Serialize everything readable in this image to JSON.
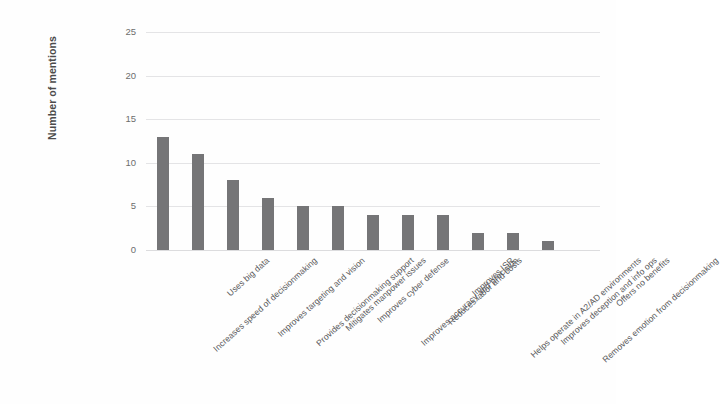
{
  "chart_data": {
    "type": "bar",
    "title": "",
    "xlabel": "",
    "ylabel": "Number of mentions",
    "ylim": [
      0,
      25
    ],
    "yticks": [
      0,
      5,
      10,
      15,
      20,
      25
    ],
    "grid": true,
    "legend": "none",
    "orientation": "vertical",
    "bar_color": "#757577",
    "categories": [
      "Increases speed of decisionmaking",
      "Uses big data",
      "Improves targeting and vision",
      "Provides decisionmaking support",
      "Mitigates manpower issues",
      "Improves cyber defense",
      "Improves accuracy and precision",
      "Reduces labor and costs",
      "Improves ISR",
      "Helps operate in A2/AD environments",
      "Improves deception and info ops",
      "Removes emotion from decisionmaking",
      "Offers no benefits"
    ],
    "values": [
      13,
      11,
      8,
      6,
      5,
      5,
      4,
      4,
      4,
      2,
      2,
      1,
      0
    ]
  },
  "axis": {
    "y_title": "Number of mentions",
    "tick_labels": [
      "0",
      "5",
      "10",
      "15",
      "20",
      "25"
    ]
  }
}
